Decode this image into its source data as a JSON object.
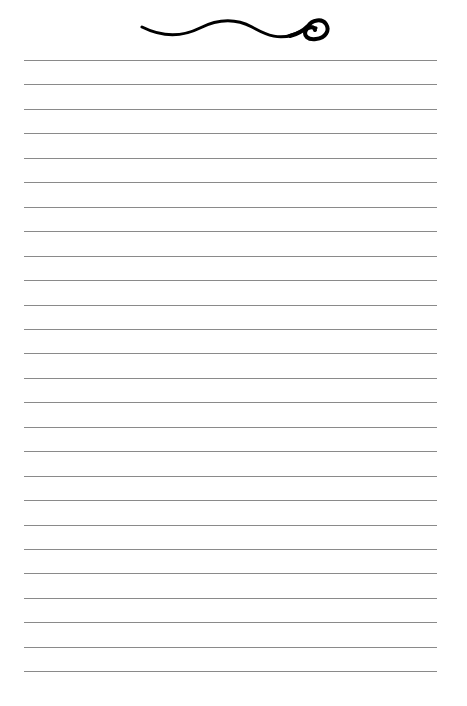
{
  "page": {
    "type": "lined-notepaper",
    "ornament": "swirl-flourish",
    "line_count": 26,
    "line_color": "#8a8a8a",
    "background": "#ffffff",
    "ornament_color": "#000000"
  }
}
